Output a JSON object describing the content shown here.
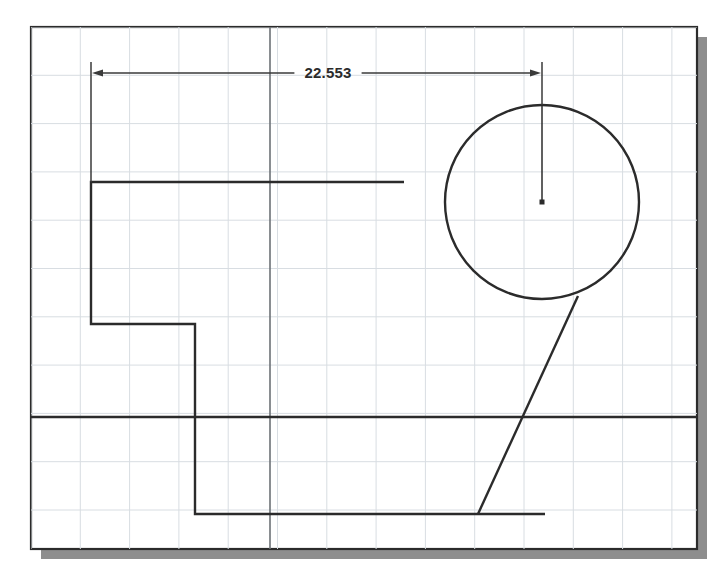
{
  "viewport": {
    "title": "Parametric Sketch Viewport",
    "width": 721,
    "height": 581,
    "background_color": "#ffffff",
    "paper": {
      "name": "sketch-sheet",
      "x": 31,
      "y": 27,
      "width": 666,
      "height": 522,
      "border_color": "#2b2b2b",
      "fill_color": "#ffffff",
      "shadow_color": "#8e8e8e",
      "shadow_offset": 10
    }
  },
  "grid": {
    "name": "sketch-grid",
    "visible": true,
    "minor_color": "#d8dde2",
    "spacing_x": 49.3,
    "spacing_y": 48.3,
    "origin_x": 31,
    "origin_y": 27
  },
  "axes": {
    "name": "construction-axes",
    "color": "#6d7276",
    "vertical_x": 270,
    "horizontal_y": 417,
    "label_vertical": "vertical-axis",
    "label_horizontal": "horizontal-axis"
  },
  "geometry": {
    "line_color": "#2b2b2b",
    "line_width": 2.4,
    "profile": {
      "name": "stepped-profile",
      "label": "Stepped L profile",
      "points": [
        [
          404,
          182
        ],
        [
          91,
          182
        ],
        [
          91,
          324
        ],
        [
          195,
          324
        ],
        [
          195,
          514
        ],
        [
          545,
          514
        ]
      ]
    },
    "base_line": {
      "name": "base-reference-line",
      "label": "Base reference line",
      "x1": 31,
      "y1": 417,
      "x2": 697,
      "y2": 417
    },
    "circle": {
      "name": "sketch-circle",
      "label": "Circle",
      "cx": 542,
      "cy": 202,
      "r": 97,
      "center_marker": "center-point-marker"
    },
    "radius_line": {
      "name": "circle-radius-line",
      "label": "Radius construction line",
      "x1": 542,
      "y1": 202,
      "x2": 542,
      "y2": 105
    },
    "tangent_line": {
      "name": "tangent-diagonal-line",
      "label": "Tangent diagonal line",
      "x1": 578,
      "y1": 296,
      "x2": 478,
      "y2": 514
    }
  },
  "dimension": {
    "name": "horizontal-dimension",
    "label": "Horizontal linear dimension",
    "value": "22.553",
    "units": "",
    "color": "#3a3a3a",
    "dim_line_y": 73,
    "left_x": 91,
    "right_x": 542,
    "text_x": 328,
    "text_y": 78,
    "extension_lines": [
      {
        "name": "extension-line-left",
        "x": 91,
        "y1": 62,
        "y2": 182
      },
      {
        "name": "extension-line-right",
        "x": 542,
        "y1": 62,
        "y2": 105
      }
    ],
    "arrowheads": [
      {
        "name": "arrowhead-left",
        "x": 91,
        "y": 73,
        "direction": "left"
      },
      {
        "name": "arrowhead-right",
        "x": 542,
        "y": 73,
        "direction": "right"
      }
    ]
  },
  "chart_data": {
    "type": "table",
    "columns": [
      "entity",
      "type",
      "value"
    ],
    "rows": [
      [
        "stepped-profile",
        "polyline",
        "6 vertices"
      ],
      [
        "sketch-circle",
        "circle",
        "r = 97 px"
      ],
      [
        "tangent-diagonal-line",
        "line",
        "tangent"
      ],
      [
        "horizontal-dimension",
        "dimension",
        "22.553"
      ]
    ]
  }
}
